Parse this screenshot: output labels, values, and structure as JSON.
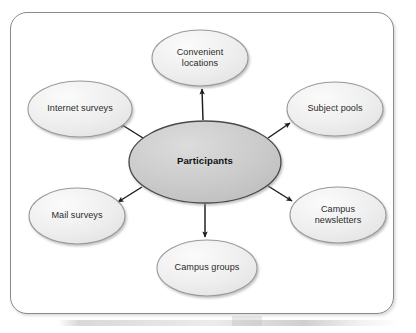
{
  "diagram": {
    "type": "hub-and-spoke",
    "frame": {
      "border_color": "#8a8a8c",
      "background_color": "#ffffff",
      "corner_radius": 17
    },
    "colors": {
      "center_fill": "#c9c9c9",
      "center_stroke": "#4a4a4a",
      "node_fill": "#eeeeee",
      "node_stroke": "#9a9a9c",
      "arrow": "#1c1c1c",
      "text": "#2b2b2b"
    },
    "center": {
      "id": "participants",
      "label": "Participants",
      "cx": 205,
      "cy": 162,
      "rx": 76,
      "ry": 41,
      "bold": true
    },
    "nodes": [
      {
        "id": "convenient-locations",
        "label": "Convenient\nlocations",
        "cx": 200,
        "cy": 58,
        "rx": 48,
        "ry": 28,
        "arrow_direction": "up",
        "arrow": {
          "x1": 203,
          "y1": 120,
          "x2": 202,
          "y2": 88
        }
      },
      {
        "id": "subject-pools",
        "label": "Subject pools",
        "cx": 335,
        "cy": 109,
        "rx": 48,
        "ry": 27,
        "arrow_direction": "up-right",
        "arrow": {
          "x1": 268,
          "y1": 137,
          "x2": 291,
          "y2": 122
        }
      },
      {
        "id": "campus-newsletters",
        "label": "Campus\nnewsletters",
        "cx": 338,
        "cy": 215,
        "rx": 48,
        "ry": 28,
        "arrow_direction": "down-right",
        "arrow": {
          "x1": 268,
          "y1": 186,
          "x2": 293,
          "y2": 202
        }
      },
      {
        "id": "campus-groups",
        "label": "Campus groups",
        "cx": 207,
        "cy": 268,
        "rx": 50,
        "ry": 28,
        "arrow_direction": "down",
        "arrow": {
          "x1": 205,
          "y1": 204,
          "x2": 205,
          "y2": 238
        }
      },
      {
        "id": "mail-surveys",
        "label": "Mail surveys",
        "cx": 77,
        "cy": 216,
        "rx": 48,
        "ry": 28,
        "arrow_direction": "down-left",
        "arrow": {
          "x1": 141,
          "y1": 187,
          "x2": 117,
          "y2": 203
        }
      },
      {
        "id": "internet-surveys",
        "label": "Internet surveys",
        "cx": 80,
        "cy": 109,
        "rx": 52,
        "ry": 28,
        "arrow_direction": "up-left",
        "arrow": {
          "x1": 143,
          "y1": 137,
          "x2": 118,
          "y2": 122
        }
      }
    ]
  }
}
